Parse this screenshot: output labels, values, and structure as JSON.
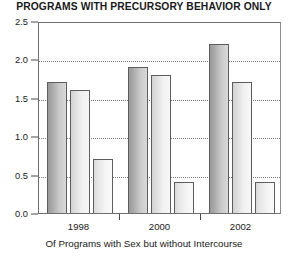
{
  "chart_data": {
    "type": "bar",
    "title": "PROGRAMS WITH PRECURSORY BEHAVIOR ONLY",
    "xlabel": "Of Programs with Sex but without Intercourse",
    "ylabel": "",
    "ylim": [
      0.0,
      2.5
    ],
    "yticks": [
      "0.0",
      "0.5",
      "1.0",
      "1.5",
      "2.0",
      "2.5"
    ],
    "ytick_values": [
      0.0,
      0.5,
      1.0,
      1.5,
      2.0,
      2.5
    ],
    "grid": true,
    "legend": "none",
    "categories": [
      "1998",
      "2000",
      "2002"
    ],
    "series": [
      {
        "name": "bar-1",
        "values": [
          1.7,
          1.9,
          2.2
        ],
        "style": "dark"
      },
      {
        "name": "bar-2",
        "values": [
          1.6,
          1.8,
          1.7
        ],
        "style": "light"
      },
      {
        "name": "bar-3",
        "values": [
          0.7,
          0.4,
          0.4
        ],
        "style": "lightest"
      }
    ]
  }
}
